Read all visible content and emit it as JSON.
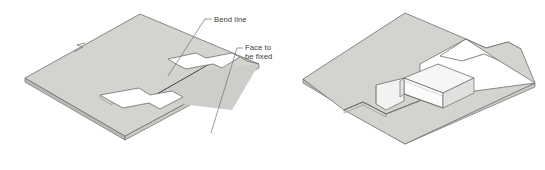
{
  "figure": {
    "background_color": "#ffffff",
    "line_color": "#6e6e6e",
    "dark_line_color": "#3f3f3f",
    "face_fill": "#d3d3cf",
    "face_fill_shadow": "#c2c2be",
    "face_fill_light": "#ececeb",
    "face_fill_white": "#fbfbfa",
    "text_color": "#3a3a3a"
  },
  "annotations": [
    {
      "id": "bend-line",
      "label": "Bend line",
      "lines": [
        "Bend line"
      ],
      "text_x": 216,
      "text_y": 21,
      "leader_points": "212,19 205,19 168,76",
      "points_to": "bend line on flat pattern"
    },
    {
      "id": "face-to-be-fixed",
      "label": "Face to be fixed",
      "lines": [
        "Face to",
        "be fixed"
      ],
      "text_x": 246,
      "text_y": 50,
      "leader_points": "243,48 237,48 211,133",
      "points_to": "large stationary face of flat pattern"
    }
  ],
  "views": [
    {
      "id": "flat-pattern",
      "name": "Flat pattern view",
      "description": "Isometric flat sheet with stepped slots and a marked bend line",
      "position": "left"
    },
    {
      "id": "bent-result",
      "name": "Bent result view",
      "description": "Isometric sheet after forming, showing raised U-channel",
      "position": "right"
    }
  ],
  "marks": [
    {
      "id": "surface-finish-mark",
      "name": "squiggle-mark",
      "x": 79,
      "y": 49
    }
  ]
}
